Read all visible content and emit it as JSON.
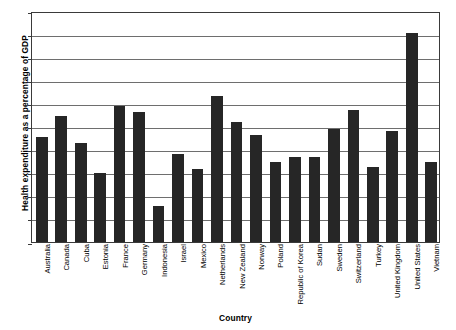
{
  "chart_data": {
    "type": "bar",
    "title": "",
    "xlabel": "Country",
    "ylabel": "Health expenditure as a percentage of GDP",
    "ylim": [
      0,
      20
    ],
    "ytick_step": 2,
    "yticks": [
      "0",
      "2",
      "4",
      "6",
      "8",
      "10",
      "12",
      "14",
      "16",
      "18",
      "20"
    ],
    "grid": true,
    "legend": "none",
    "bar_color": "#262626",
    "categories": [
      "Australia",
      "Canada",
      "Cuba",
      "Estonia",
      "France",
      "Germany",
      "Indonesia",
      "Israel",
      "Mexico",
      "Netherlands",
      "New Zealand",
      "Norway",
      "Poland",
      "Republic of Korea",
      "Sudan",
      "Sweden",
      "Switzerland",
      "Turkey",
      "United Kingdom",
      "United States",
      "Vietnam"
    ],
    "values": [
      9.1,
      10.9,
      8.6,
      6.0,
      11.8,
      11.3,
      3.1,
      7.6,
      6.3,
      12.6,
      10.4,
      9.3,
      6.9,
      7.4,
      7.4,
      9.8,
      11.4,
      6.5,
      9.6,
      18.1,
      6.9
    ]
  }
}
